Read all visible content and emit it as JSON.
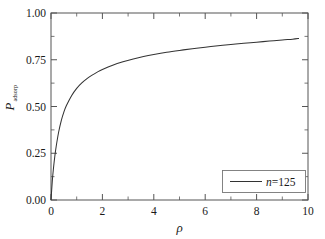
{
  "chart_data": {
    "type": "line",
    "title": "",
    "subtitle": "",
    "xlabel": "ρ",
    "ylabel": "P",
    "ylabel_subscript": "adsorp",
    "xlim": [
      0,
      10
    ],
    "ylim": [
      0.0,
      1.0
    ],
    "grid": false,
    "legend_position": "bottom-right",
    "x_ticks": [
      "0",
      "2",
      "4",
      "6",
      "8",
      "10"
    ],
    "x_tick_values": [
      0,
      2,
      4,
      6,
      8,
      10
    ],
    "x_minor_step": 1,
    "y_ticks": [
      "0.00",
      "0.25",
      "0.50",
      "0.75",
      "1.00"
    ],
    "y_tick_values": [
      0.0,
      0.25,
      0.5,
      0.75,
      1.0
    ],
    "y_minor_step": 0.125,
    "series": [
      {
        "name": "n=125",
        "name_symbol": "n",
        "name_value": "=125",
        "color": "#333333",
        "x": [
          0.0,
          0.05,
          0.1,
          0.15,
          0.2,
          0.3,
          0.4,
          0.5,
          0.6,
          0.8,
          1.0,
          1.2,
          1.4,
          1.6,
          1.8,
          2.0,
          2.4,
          2.8,
          3.2,
          3.6,
          4.0,
          4.5,
          5.0,
          5.5,
          6.0,
          6.5,
          7.0,
          7.5,
          8.0,
          8.5,
          9.0,
          9.4,
          9.65
        ],
        "y": [
          0.0,
          0.1,
          0.175,
          0.235,
          0.285,
          0.365,
          0.425,
          0.47,
          0.505,
          0.558,
          0.597,
          0.626,
          0.649,
          0.668,
          0.684,
          0.698,
          0.721,
          0.739,
          0.754,
          0.767,
          0.778,
          0.79,
          0.8,
          0.809,
          0.817,
          0.825,
          0.832,
          0.838,
          0.844,
          0.85,
          0.856,
          0.86,
          0.864
        ]
      }
    ],
    "annotations": []
  },
  "legend": {
    "entries": [
      {
        "symbol": "n",
        "value": "=125"
      }
    ]
  },
  "axes": {
    "x_title": "ρ",
    "y_title_main": "P",
    "y_title_sub": "adsorp"
  }
}
